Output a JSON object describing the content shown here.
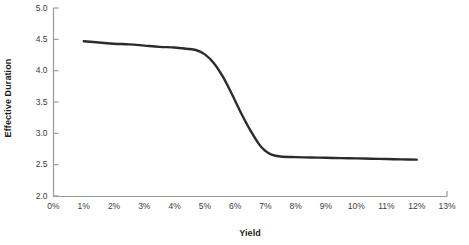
{
  "chart_data": {
    "type": "line",
    "title": "",
    "xlabel": "Yield",
    "ylabel": "Effective Duration",
    "xlim": [
      0,
      13
    ],
    "ylim": [
      2.0,
      5.0
    ],
    "grid": false,
    "legend": null,
    "x_tick_labels": [
      "0%",
      "1%",
      "2%",
      "3%",
      "4%",
      "5%",
      "6%",
      "7%",
      "8%",
      "9%",
      "10%",
      "11%",
      "12%",
      "13%"
    ],
    "x_tick_values": [
      0,
      1,
      2,
      3,
      4,
      5,
      6,
      7,
      8,
      9,
      10,
      11,
      12,
      13
    ],
    "y_tick_labels": [
      "2.0",
      "2.5",
      "3.0",
      "3.5",
      "4.0",
      "4.5",
      "5.0"
    ],
    "y_tick_values": [
      2.0,
      2.5,
      3.0,
      3.5,
      4.0,
      4.5,
      5.0
    ],
    "series": [
      {
        "name": "Effective Duration",
        "color": "#2b2b2b",
        "line_width": 2.4,
        "x": [
          1.0,
          1.5,
          2.0,
          2.5,
          3.0,
          3.5,
          4.0,
          4.4,
          4.7,
          5.0,
          5.3,
          5.6,
          5.9,
          6.2,
          6.5,
          6.8,
          7.0,
          7.2,
          7.5,
          8.0,
          8.5,
          9.0,
          9.5,
          10.0,
          10.5,
          11.0,
          11.5,
          12.0
        ],
        "y": [
          4.47,
          4.45,
          4.43,
          4.42,
          4.4,
          4.38,
          4.37,
          4.35,
          4.33,
          4.26,
          4.12,
          3.9,
          3.62,
          3.32,
          3.05,
          2.82,
          2.72,
          2.66,
          2.63,
          2.62,
          2.615,
          2.61,
          2.605,
          2.6,
          2.595,
          2.59,
          2.585,
          2.58
        ]
      }
    ]
  },
  "axis_style": {
    "axis_color": "#9a9a9a",
    "tick_label_color": "#3a3a3a",
    "title_color": "#231f20",
    "background": "#ffffff"
  }
}
